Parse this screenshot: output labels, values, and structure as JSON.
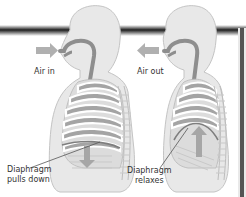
{
  "diagram": {
    "panels": [
      {
        "id": "inhale",
        "air_label": "Air in",
        "diaphragm_label_line1": "Diaphragm",
        "diaphragm_label_line2": "pulls down",
        "air_arrow_direction": "right",
        "diaphragm_arrow_direction": "down"
      },
      {
        "id": "exhale",
        "air_label": "Air out",
        "diaphragm_label_line1": "Diaphragm",
        "diaphragm_label_line2": "relaxes",
        "air_arrow_direction": "left",
        "diaphragm_arrow_direction": "up"
      }
    ],
    "colors": {
      "body_fill": "#e6e6e6",
      "body_outline": "#bdbdbd",
      "airway": "#8a8a8a",
      "lung": "#9c9c9c",
      "ribs": "#ffffff",
      "arrow": "#a8a8a8",
      "bar": "#2a2a2a"
    }
  }
}
